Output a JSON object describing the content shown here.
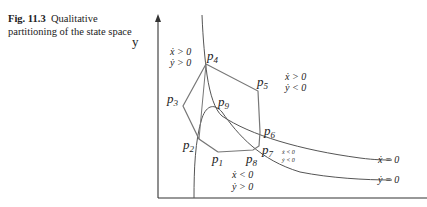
{
  "caption": {
    "figure_number": "Fig. 11.3",
    "text_line1": "Qualitative",
    "text_line2": "partitioning of the state space"
  },
  "axes": {
    "y_label": "y",
    "x_label": "x"
  },
  "points": {
    "p1": "p",
    "p1_sub": "1",
    "p2": "p",
    "p2_sub": "2",
    "p3": "p",
    "p3_sub": "3",
    "p4": "p",
    "p4_sub": "4",
    "p5": "p",
    "p5_sub": "5",
    "p6": "p",
    "p6_sub": "6",
    "p7": "p",
    "p7_sub": "7",
    "p8": "p",
    "p8_sub": "8",
    "p9": "p",
    "p9_sub": "9"
  },
  "regions": {
    "top_left": [
      "ẋ > 0",
      "ẏ > 0"
    ],
    "top_right": [
      "ẋ > 0",
      "ẏ < 0"
    ],
    "bottom": [
      "ẋ < 0",
      "ẏ > 0"
    ],
    "small_right": [
      "ẋ < 0",
      "ẏ < 0"
    ]
  },
  "nullclines": {
    "xdot": "ẋ = 0",
    "ydot": "ẏ = 0"
  },
  "colors": {
    "curve": "#555555",
    "polygon": "#777777",
    "axis": "#333333"
  }
}
